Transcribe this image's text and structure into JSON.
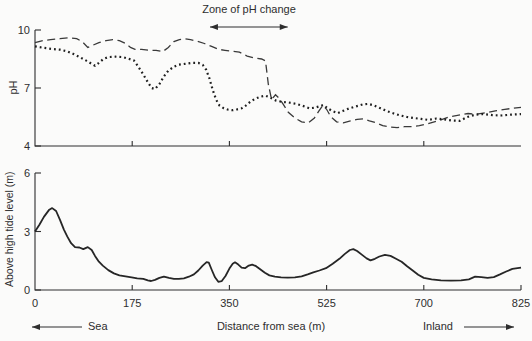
{
  "page": {
    "background": "#fbfbfa",
    "ink": "#2e2e2e"
  },
  "labels": {
    "zone_annotation": "Zone of pH change",
    "ph_axis": "pH",
    "elevation_axis": "Above high tide level (m)",
    "distance_axis": "Distance from sea (m)",
    "sea": "Sea",
    "inland": "Inland"
  },
  "chart_data": [
    {
      "type": "line",
      "title": "",
      "ylabel": "pH",
      "ylim": [
        4,
        10
      ],
      "yticks": [
        10,
        7,
        4
      ],
      "ytick_labels": [
        "10",
        "7",
        "4"
      ],
      "xlabel": "Distance from sea (m)",
      "xlim": [
        0,
        825
      ],
      "xticks": [
        0,
        175,
        350,
        525,
        700,
        825
      ],
      "xtick_labels": [
        "0",
        "175",
        "350",
        "525",
        "700",
        "825"
      ],
      "x_axis_note": "tick interval 700-825 drawn same width as 175 m intervals",
      "grid": false,
      "legend": "none",
      "annotation": {
        "text": "Zone of pH change",
        "x_from_m": 315,
        "x_to_m": 455,
        "arrow": "double-headed"
      },
      "series": [
        {
          "name": "dashed-ph-series",
          "style": "dashed",
          "points": [
            [
              0,
              9.35
            ],
            [
              14,
              9.45
            ],
            [
              28,
              9.5
            ],
            [
              45,
              9.55
            ],
            [
              62,
              9.6
            ],
            [
              75,
              9.55
            ],
            [
              85,
              9.4
            ],
            [
              95,
              9.1
            ],
            [
              103,
              9.2
            ],
            [
              115,
              9.35
            ],
            [
              128,
              9.45
            ],
            [
              140,
              9.5
            ],
            [
              152,
              9.45
            ],
            [
              163,
              9.3
            ],
            [
              172,
              9.1
            ],
            [
              180,
              9.0
            ],
            [
              192,
              9.0
            ],
            [
              205,
              8.95
            ],
            [
              218,
              8.95
            ],
            [
              230,
              8.88
            ],
            [
              240,
              9.1
            ],
            [
              250,
              9.4
            ],
            [
              260,
              9.5
            ],
            [
              268,
              9.55
            ],
            [
              280,
              9.5
            ],
            [
              292,
              9.42
            ],
            [
              305,
              9.3
            ],
            [
              318,
              9.15
            ],
            [
              330,
              9.0
            ],
            [
              342,
              8.95
            ],
            [
              355,
              8.9
            ],
            [
              368,
              8.85
            ],
            [
              382,
              8.65
            ],
            [
              395,
              8.55
            ],
            [
              408,
              8.5
            ],
            [
              415,
              8.4
            ],
            [
              420,
              7.2
            ],
            [
              426,
              6.4
            ],
            [
              433,
              6.65
            ],
            [
              440,
              6.45
            ],
            [
              447,
              6.15
            ],
            [
              456,
              5.75
            ],
            [
              468,
              5.45
            ],
            [
              480,
              5.25
            ],
            [
              492,
              5.2
            ],
            [
              503,
              5.45
            ],
            [
              511,
              5.8
            ],
            [
              518,
              6.1
            ],
            [
              525,
              5.9
            ],
            [
              533,
              5.5
            ],
            [
              543,
              5.25
            ],
            [
              555,
              5.2
            ],
            [
              568,
              5.3
            ],
            [
              580,
              5.38
            ],
            [
              592,
              5.4
            ],
            [
              602,
              5.3
            ],
            [
              614,
              5.2
            ],
            [
              626,
              5.05
            ],
            [
              640,
              4.98
            ],
            [
              652,
              4.95
            ],
            [
              665,
              5.0
            ],
            [
              678,
              5.0
            ],
            [
              692,
              5.05
            ],
            [
              705,
              5.15
            ],
            [
              718,
              5.3
            ],
            [
              732,
              5.5
            ],
            [
              745,
              5.6
            ],
            [
              757,
              5.68
            ],
            [
              768,
              5.65
            ],
            [
              780,
              5.72
            ],
            [
              792,
              5.82
            ],
            [
              804,
              5.9
            ],
            [
              815,
              5.95
            ],
            [
              825,
              6.0
            ]
          ]
        },
        {
          "name": "dotted-ph-series",
          "style": "dotted",
          "points": [
            [
              0,
              9.15
            ],
            [
              15,
              9.08
            ],
            [
              30,
              9.02
            ],
            [
              45,
              8.98
            ],
            [
              58,
              8.9
            ],
            [
              70,
              8.75
            ],
            [
              82,
              8.58
            ],
            [
              93,
              8.4
            ],
            [
              102,
              8.25
            ],
            [
              108,
              8.15
            ],
            [
              115,
              8.3
            ],
            [
              123,
              8.5
            ],
            [
              132,
              8.6
            ],
            [
              145,
              8.62
            ],
            [
              158,
              8.6
            ],
            [
              168,
              8.52
            ],
            [
              178,
              8.42
            ],
            [
              186,
              8.1
            ],
            [
              195,
              7.7
            ],
            [
              203,
              7.3
            ],
            [
              210,
              7.0
            ],
            [
              216,
              6.95
            ],
            [
              224,
              7.2
            ],
            [
              232,
              7.6
            ],
            [
              240,
              7.9
            ],
            [
              250,
              8.1
            ],
            [
              258,
              8.2
            ],
            [
              270,
              8.25
            ],
            [
              282,
              8.3
            ],
            [
              294,
              8.3
            ],
            [
              302,
              8.2
            ],
            [
              308,
              7.95
            ],
            [
              314,
              7.5
            ],
            [
              320,
              6.9
            ],
            [
              326,
              6.4
            ],
            [
              332,
              6.1
            ],
            [
              340,
              5.95
            ],
            [
              348,
              5.88
            ],
            [
              356,
              5.85
            ],
            [
              364,
              5.9
            ],
            [
              372,
              5.95
            ],
            [
              380,
              6.1
            ],
            [
              388,
              6.3
            ],
            [
              397,
              6.45
            ],
            [
              406,
              6.55
            ],
            [
              415,
              6.6
            ],
            [
              424,
              6.5
            ],
            [
              434,
              6.35
            ],
            [
              445,
              6.28
            ],
            [
              457,
              6.25
            ],
            [
              470,
              6.18
            ],
            [
              482,
              6.08
            ],
            [
              494,
              5.95
            ],
            [
              504,
              5.98
            ],
            [
              512,
              6.05
            ],
            [
              519,
              6.12
            ],
            [
              527,
              5.95
            ],
            [
              536,
              5.8
            ],
            [
              545,
              5.7
            ],
            [
              555,
              5.82
            ],
            [
              566,
              5.95
            ],
            [
              578,
              6.05
            ],
            [
              590,
              6.15
            ],
            [
              600,
              6.18
            ],
            [
              610,
              6.1
            ],
            [
              622,
              5.95
            ],
            [
              634,
              5.8
            ],
            [
              646,
              5.68
            ],
            [
              658,
              5.58
            ],
            [
              670,
              5.5
            ],
            [
              682,
              5.45
            ],
            [
              695,
              5.4
            ],
            [
              706,
              5.35
            ],
            [
              716,
              5.42
            ],
            [
              726,
              5.38
            ],
            [
              736,
              5.32
            ],
            [
              746,
              5.3
            ],
            [
              756,
              5.5
            ],
            [
              766,
              5.62
            ],
            [
              776,
              5.65
            ],
            [
              788,
              5.6
            ],
            [
              800,
              5.58
            ],
            [
              812,
              5.62
            ],
            [
              825,
              5.65
            ]
          ]
        }
      ]
    },
    {
      "type": "line",
      "title": "",
      "ylabel": "Above high tide level (m)",
      "ylim": [
        0,
        6
      ],
      "yticks": [
        6,
        3,
        0
      ],
      "ytick_labels": [
        "6",
        "3",
        "0"
      ],
      "xlabel": "Distance from sea (m)",
      "xlim": [
        0,
        825
      ],
      "xticks": [
        0,
        175,
        350,
        525,
        700,
        825
      ],
      "xtick_labels": [
        "0",
        "175",
        "350",
        "525",
        "700",
        "825"
      ],
      "grid": false,
      "legend": "none",
      "series": [
        {
          "name": "terrain-profile",
          "style": "solid",
          "points": [
            [
              0,
              3.0
            ],
            [
              8,
              3.35
            ],
            [
              16,
              3.75
            ],
            [
              25,
              4.1
            ],
            [
              31,
              4.2
            ],
            [
              38,
              4.05
            ],
            [
              45,
              3.6
            ],
            [
              52,
              3.1
            ],
            [
              58,
              2.75
            ],
            [
              65,
              2.4
            ],
            [
              72,
              2.2
            ],
            [
              80,
              2.18
            ],
            [
              87,
              2.1
            ],
            [
              95,
              2.2
            ],
            [
              102,
              2.05
            ],
            [
              108,
              1.75
            ],
            [
              115,
              1.45
            ],
            [
              122,
              1.25
            ],
            [
              132,
              1.02
            ],
            [
              142,
              0.85
            ],
            [
              152,
              0.75
            ],
            [
              163,
              0.7
            ],
            [
              174,
              0.65
            ],
            [
              184,
              0.6
            ],
            [
              195,
              0.57
            ],
            [
              203,
              0.5
            ],
            [
              209,
              0.46
            ],
            [
              216,
              0.52
            ],
            [
              224,
              0.62
            ],
            [
              232,
              0.68
            ],
            [
              241,
              0.62
            ],
            [
              250,
              0.57
            ],
            [
              259,
              0.57
            ],
            [
              268,
              0.6
            ],
            [
              277,
              0.68
            ],
            [
              286,
              0.8
            ],
            [
              294,
              1.0
            ],
            [
              302,
              1.25
            ],
            [
              309,
              1.43
            ],
            [
              313,
              1.4
            ],
            [
              318,
              1.05
            ],
            [
              324,
              0.65
            ],
            [
              330,
              0.42
            ],
            [
              336,
              0.45
            ],
            [
              343,
              0.72
            ],
            [
              350,
              1.1
            ],
            [
              356,
              1.35
            ],
            [
              360,
              1.42
            ],
            [
              366,
              1.3
            ],
            [
              372,
              1.15
            ],
            [
              378,
              1.12
            ],
            [
              385,
              1.25
            ],
            [
              391,
              1.3
            ],
            [
              398,
              1.22
            ],
            [
              406,
              1.05
            ],
            [
              414,
              0.88
            ],
            [
              422,
              0.75
            ],
            [
              432,
              0.68
            ],
            [
              443,
              0.65
            ],
            [
              455,
              0.63
            ],
            [
              468,
              0.65
            ],
            [
              480,
              0.7
            ],
            [
              491,
              0.8
            ],
            [
              501,
              0.9
            ],
            [
              512,
              1.0
            ],
            [
              524,
              1.12
            ],
            [
              536,
              1.35
            ],
            [
              548,
              1.6
            ],
            [
              558,
              1.85
            ],
            [
              567,
              2.05
            ],
            [
              573,
              2.1
            ],
            [
              580,
              2.0
            ],
            [
              589,
              1.8
            ],
            [
              597,
              1.62
            ],
            [
              604,
              1.52
            ],
            [
              612,
              1.6
            ],
            [
              620,
              1.72
            ],
            [
              630,
              1.8
            ],
            [
              640,
              1.75
            ],
            [
              650,
              1.6
            ],
            [
              660,
              1.45
            ],
            [
              670,
              1.22
            ],
            [
              680,
              1.0
            ],
            [
              690,
              0.78
            ],
            [
              700,
              0.62
            ],
            [
              710,
              0.55
            ],
            [
              722,
              0.5
            ],
            [
              735,
              0.48
            ],
            [
              748,
              0.5
            ],
            [
              758,
              0.55
            ],
            [
              766,
              0.68
            ],
            [
              774,
              0.66
            ],
            [
              782,
              0.62
            ],
            [
              790,
              0.66
            ],
            [
              798,
              0.8
            ],
            [
              806,
              0.95
            ],
            [
              814,
              1.08
            ],
            [
              825,
              1.15
            ]
          ]
        }
      ]
    }
  ]
}
